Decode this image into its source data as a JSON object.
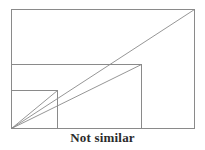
{
  "figure": {
    "caption": "Not similar",
    "background_color": "#ffffff",
    "stroke_color": "#8a8a8a",
    "diagonal_color": "#8a8a8a",
    "caption_color": "#2b2b2b",
    "canvas": {
      "width": 205,
      "height": 150
    },
    "shared_corner": {
      "x": 11,
      "y": 128,
      "label": "common-bottom-left-corner"
    },
    "rectangles": [
      {
        "name": "large-rectangle",
        "x": 11,
        "y": 9,
        "width": 183,
        "height": 119,
        "aspect_ratio": "1.54"
      },
      {
        "name": "medium-rectangle",
        "x": 11,
        "y": 64,
        "width": 130,
        "height": 64,
        "aspect_ratio": "2.03"
      },
      {
        "name": "small-rectangle",
        "x": 11,
        "y": 90,
        "width": 46,
        "height": 38,
        "aspect_ratio": "1.21"
      }
    ],
    "diagonals": [
      {
        "name": "diagonal-large",
        "x1": 11,
        "y1": 128,
        "x2": 194,
        "y2": 9
      },
      {
        "name": "diagonal-medium",
        "x1": 11,
        "y1": 128,
        "x2": 141,
        "y2": 64
      },
      {
        "name": "diagonal-small",
        "x1": 11,
        "y1": 128,
        "x2": 57,
        "y2": 90
      }
    ]
  }
}
